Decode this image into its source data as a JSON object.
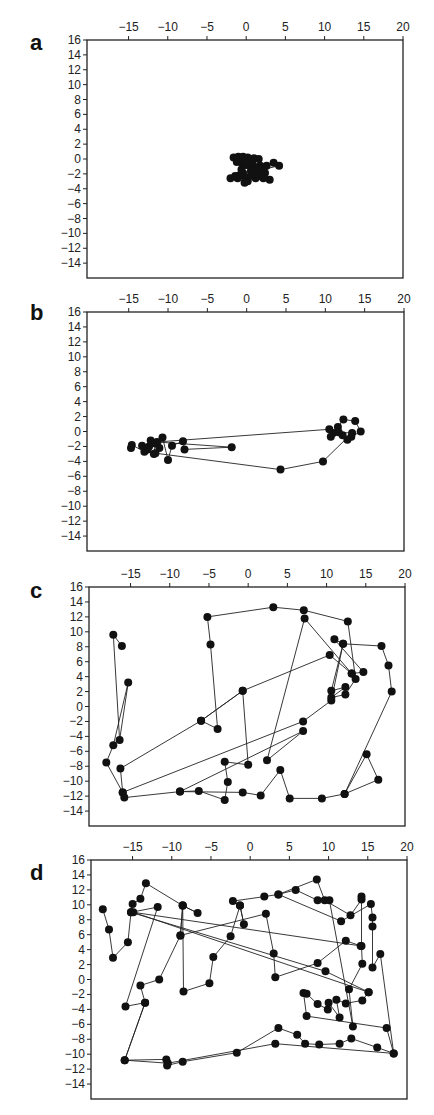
{
  "figure": {
    "panels": [
      "a",
      "b",
      "c",
      "d"
    ]
  },
  "chart_data": [
    {
      "type": "line",
      "panel_label": "a",
      "title": "",
      "xlabel": "",
      "ylabel": "",
      "x_ticks": [
        -15,
        -10,
        -5,
        0,
        5,
        10,
        15,
        20
      ],
      "y_ticks": [
        16,
        14,
        12,
        10,
        8,
        6,
        4,
        2,
        0,
        -2,
        -4,
        -6,
        -8,
        -10,
        -12,
        -14
      ],
      "xlim": [
        -20.3,
        20
      ],
      "ylim": [
        -16,
        16
      ],
      "x_axis_position": "top",
      "grid": false,
      "markers": "filled-circle",
      "points": [
        [
          -1.6,
          0.2
        ],
        [
          -1.0,
          0.3
        ],
        [
          -0.4,
          0.3
        ],
        [
          0.2,
          0.2
        ],
        [
          1.0,
          0.1
        ],
        [
          1.6,
          0.0
        ],
        [
          -1.2,
          -0.4
        ],
        [
          -0.5,
          -0.6
        ],
        [
          0.3,
          -0.8
        ],
        [
          1.0,
          -1.0
        ],
        [
          1.8,
          -0.9
        ],
        [
          2.6,
          -0.9
        ],
        [
          3.5,
          -0.5
        ],
        [
          4.2,
          -0.9
        ],
        [
          2.2,
          -1.4
        ],
        [
          1.4,
          -1.8
        ],
        [
          0.6,
          -1.6
        ],
        [
          -0.4,
          -1.9
        ],
        [
          -0.9,
          -2.2
        ],
        [
          -0.2,
          -2.4
        ],
        [
          0.6,
          -2.2
        ],
        [
          1.6,
          -2.3
        ],
        [
          2.4,
          -1.9
        ],
        [
          3.0,
          -2.8
        ],
        [
          2.2,
          -2.6
        ],
        [
          1.2,
          -2.6
        ],
        [
          0.2,
          -3.0
        ],
        [
          -0.2,
          -3.2
        ],
        [
          -1.1,
          -2.6
        ],
        [
          -2.0,
          -2.6
        ],
        [
          -1.4,
          -2.3
        ],
        [
          -0.6,
          -1.4
        ],
        [
          0.0,
          -0.8
        ],
        [
          0.8,
          -0.3
        ],
        [
          1.4,
          -1.2
        ]
      ]
    },
    {
      "type": "line",
      "panel_label": "b",
      "title": "",
      "xlabel": "",
      "ylabel": "",
      "x_ticks": [
        -15,
        -10,
        -5,
        0,
        5,
        10,
        15,
        20
      ],
      "y_ticks": [
        16,
        14,
        12,
        10,
        8,
        6,
        4,
        2,
        0,
        -2,
        -4,
        -6,
        -8,
        -10,
        -12,
        -14
      ],
      "xlim": [
        -20.3,
        20
      ],
      "ylim": [
        -16,
        16
      ],
      "x_axis_position": "top",
      "grid": false,
      "markers": "filled-circle",
      "points": [
        [
          -14.7,
          -2.2
        ],
        [
          -14.6,
          -1.8
        ],
        [
          -13.0,
          -2.7
        ],
        [
          -12.4,
          -2.0
        ],
        [
          -12.2,
          -1.2
        ],
        [
          -11.6,
          -1.6
        ],
        [
          -11.8,
          -3.0
        ],
        [
          -11.1,
          -2.2
        ],
        [
          -10.7,
          -0.8
        ],
        [
          -10.0,
          -3.8
        ],
        [
          -9.5,
          -1.9
        ],
        [
          -8.1,
          -1.3
        ],
        [
          -7.9,
          -2.4
        ],
        [
          -1.9,
          -2.1
        ],
        [
          -11.4,
          -1.4
        ],
        [
          10.5,
          0.3
        ],
        [
          11.0,
          -0.2
        ],
        [
          10.7,
          -0.7
        ],
        [
          11.6,
          0.6
        ],
        [
          12.3,
          1.6
        ],
        [
          13.8,
          1.4
        ],
        [
          14.5,
          0.0
        ],
        [
          13.3,
          -0.7
        ],
        [
          12.8,
          -1.1
        ],
        [
          12.2,
          -0.5
        ],
        [
          11.7,
          -0.1
        ],
        [
          13.4,
          -0.2
        ],
        [
          9.7,
          -4.0
        ],
        [
          4.3,
          -5.1
        ],
        [
          -11.6,
          -2.9
        ],
        [
          -12.6,
          -2.4
        ],
        [
          -13.3,
          -1.9
        ]
      ]
    },
    {
      "type": "line",
      "panel_label": "c",
      "title": "",
      "xlabel": "",
      "ylabel": "",
      "x_ticks": [
        -15,
        -10,
        -5,
        0,
        5,
        10,
        15,
        20
      ],
      "y_ticks": [
        16,
        14,
        12,
        10,
        8,
        6,
        4,
        2,
        0,
        -2,
        -4,
        -6,
        -8,
        -10,
        -12,
        -14
      ],
      "xlim": [
        -20.3,
        20
      ],
      "ylim": [
        -16,
        16
      ],
      "x_axis_position": "top",
      "grid": false,
      "markers": "filled-circle",
      "points": [
        [
          -16.1,
          8.1
        ],
        [
          -17.2,
          9.6
        ],
        [
          -16.4,
          -4.5
        ],
        [
          -15.3,
          3.2
        ],
        [
          -17.2,
          -5.2
        ],
        [
          -18.1,
          -7.5
        ],
        [
          -16.0,
          -11.5
        ],
        [
          -15.8,
          -12.2
        ],
        [
          -8.7,
          -11.4
        ],
        [
          -6.3,
          -11.3
        ],
        [
          -3.0,
          -12.5
        ],
        [
          -2.6,
          -10.1
        ],
        [
          -3.0,
          -7.4
        ],
        [
          0.0,
          -7.8
        ],
        [
          -0.7,
          2.1
        ],
        [
          -6.0,
          -1.9
        ],
        [
          -0.7,
          2.1
        ],
        [
          10.4,
          6.9
        ],
        [
          13.2,
          4.4
        ],
        [
          14.7,
          4.6
        ],
        [
          11.0,
          9.0
        ],
        [
          12.1,
          8.4
        ],
        [
          10.6,
          2.1
        ],
        [
          12.4,
          2.6
        ],
        [
          10.6,
          1.2
        ],
        [
          12.4,
          1.6
        ],
        [
          13.7,
          3.7
        ],
        [
          12.7,
          11.4
        ],
        [
          7.1,
          12.9
        ],
        [
          3.2,
          13.3
        ],
        [
          -5.2,
          12.0
        ],
        [
          -4.8,
          8.3
        ],
        [
          -3.9,
          -3.0
        ],
        [
          -6.0,
          -1.9
        ],
        [
          -16.3,
          -8.3
        ],
        [
          -16.0,
          -11.5
        ],
        [
          7.0,
          -2.0
        ],
        [
          10.6,
          0.8
        ],
        [
          12.1,
          8.4
        ],
        [
          17.0,
          8.1
        ],
        [
          17.9,
          5.5
        ],
        [
          18.3,
          2.0
        ],
        [
          12.3,
          -11.7
        ],
        [
          15.1,
          -6.4
        ],
        [
          16.6,
          -9.8
        ],
        [
          12.3,
          -11.7
        ],
        [
          9.4,
          -12.3
        ],
        [
          5.3,
          -12.3
        ],
        [
          4.1,
          -8.5
        ],
        [
          1.6,
          -11.9
        ],
        [
          -0.7,
          -11.5
        ],
        [
          -8.7,
          -11.4
        ],
        [
          7.0,
          -3.3
        ],
        [
          2.4,
          -7.2
        ],
        [
          7.2,
          11.8
        ],
        [
          13.2,
          4.4
        ]
      ]
    },
    {
      "type": "line",
      "panel_label": "d",
      "title": "",
      "xlabel": "",
      "ylabel": "",
      "x_ticks": [
        -15,
        -10,
        -5,
        0,
        5,
        10,
        15,
        20
      ],
      "y_ticks": [
        16,
        14,
        12,
        10,
        8,
        6,
        4,
        2,
        0,
        -2,
        -4,
        -6,
        -8,
        -10,
        -12,
        -14
      ],
      "xlim": [
        -20.3,
        20
      ],
      "ylim": [
        -16,
        16
      ],
      "x_axis_position": "top",
      "grid": false,
      "markers": "filled-circle",
      "points": [
        [
          -18.8,
          9.4
        ],
        [
          -18.0,
          6.7
        ],
        [
          -17.5,
          2.9
        ],
        [
          -15.6,
          5.0
        ],
        [
          -15.2,
          9.0
        ],
        [
          -15.0,
          10.1
        ],
        [
          -14.0,
          10.8
        ],
        [
          -13.3,
          12.9
        ],
        [
          -8.6,
          9.9
        ],
        [
          -6.7,
          8.9
        ],
        [
          -8.6,
          9.9
        ],
        [
          -8.9,
          5.9
        ],
        [
          -8.6,
          9.9
        ],
        [
          -8.5,
          -1.6
        ],
        [
          -5.2,
          -0.5
        ],
        [
          -4.7,
          3.0
        ],
        [
          -2.5,
          5.8
        ],
        [
          -1.3,
          9.9
        ],
        [
          -0.8,
          7.4
        ],
        [
          -1.3,
          9.9
        ],
        [
          -2.2,
          10.5
        ],
        [
          1.8,
          11.1
        ],
        [
          3.6,
          11.4
        ],
        [
          8.5,
          13.4
        ],
        [
          9.5,
          10.6
        ],
        [
          12.8,
          8.6
        ],
        [
          14.2,
          10.7
        ],
        [
          14.2,
          11.1
        ],
        [
          14.2,
          4.5
        ],
        [
          14.3,
          2.1
        ],
        [
          12.6,
          -1.3
        ],
        [
          13.1,
          -6.3
        ],
        [
          10.1,
          10.6
        ],
        [
          8.6,
          10.6
        ],
        [
          5.8,
          12.0
        ],
        [
          3.6,
          11.4
        ],
        [
          11.6,
          7.8
        ],
        [
          15.4,
          10.1
        ],
        [
          15.6,
          8.3
        ],
        [
          15.6,
          7.1
        ],
        [
          15.6,
          1.6
        ],
        [
          16.6,
          3.4
        ],
        [
          18.3,
          -9.9
        ],
        [
          17.4,
          -6.5
        ],
        [
          7.2,
          -4.9
        ],
        [
          6.8,
          -1.8
        ],
        [
          7.2,
          -1.9
        ],
        [
          8.6,
          -3.3
        ],
        [
          9.9,
          -4.0
        ],
        [
          10.0,
          -3.1
        ],
        [
          11.4,
          -5.1
        ],
        [
          11.0,
          -2.7
        ],
        [
          12.2,
          -3.2
        ],
        [
          14.3,
          -2.8
        ],
        [
          15.1,
          -1.7
        ],
        [
          9.6,
          1.1
        ],
        [
          -15.2,
          9.0
        ],
        [
          -11.8,
          9.7
        ],
        [
          -15.9,
          -3.6
        ],
        [
          -13.4,
          -3.1
        ],
        [
          -16.0,
          -10.8
        ],
        [
          -10.7,
          -10.7
        ],
        [
          -10.6,
          -11.5
        ],
        [
          -8.6,
          -11.0
        ],
        [
          -1.7,
          -9.8
        ],
        [
          3.6,
          -6.5
        ],
        [
          6.0,
          -7.4
        ],
        [
          7.0,
          -8.6
        ],
        [
          8.8,
          -8.7
        ],
        [
          11.4,
          -8.6
        ],
        [
          12.9,
          -7.9
        ],
        [
          16.2,
          -9.1
        ],
        [
          18.3,
          -9.9
        ],
        [
          3.2,
          -8.6
        ],
        [
          -10.5,
          -11.2
        ],
        [
          -16.0,
          -10.8
        ],
        [
          -13.4,
          -3.1
        ],
        [
          -14.0,
          -0.8
        ],
        [
          -11.6,
          0.0
        ],
        [
          -8.9,
          5.9
        ],
        [
          2.0,
          8.8
        ],
        [
          3.0,
          3.5
        ],
        [
          3.2,
          0.3
        ],
        [
          8.6,
          2.2
        ],
        [
          12.2,
          5.2
        ],
        [
          14.1,
          4.5
        ],
        [
          -14.9,
          9.0
        ],
        [
          15.1,
          -1.7
        ]
      ]
    }
  ]
}
